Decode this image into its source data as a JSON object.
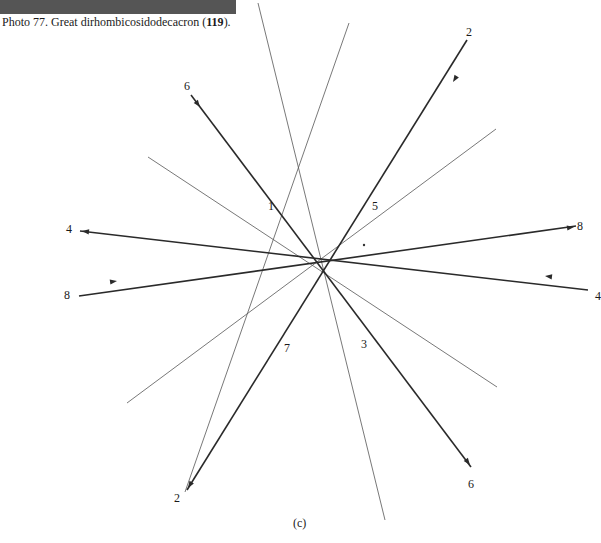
{
  "caption": {
    "prefix": "Photo 77.  Great dirhombicosidodecacron (",
    "number": "119",
    "suffix": ")."
  },
  "figure_label": "(c)",
  "vertex_labels": [
    {
      "id": "v1",
      "text": "1",
      "x": 268,
      "y": 200
    },
    {
      "id": "v5",
      "text": "5",
      "x": 372,
      "y": 200
    },
    {
      "id": "v7",
      "text": "7",
      "x": 284,
      "y": 342
    },
    {
      "id": "v3",
      "text": "3",
      "x": 361,
      "y": 338
    }
  ],
  "end_labels": [
    {
      "id": "e6-top",
      "text": "6",
      "x": 184,
      "y": 80
    },
    {
      "id": "e2-top",
      "text": "2",
      "x": 466,
      "y": 26
    },
    {
      "id": "e4-left",
      "text": "4",
      "x": 66,
      "y": 223
    },
    {
      "id": "e8-right",
      "text": "8",
      "x": 577,
      "y": 220
    },
    {
      "id": "e8-left",
      "text": "8",
      "x": 64,
      "y": 289
    },
    {
      "id": "e4-right",
      "text": "4",
      "x": 595,
      "y": 290
    },
    {
      "id": "e2-bottom",
      "text": "2",
      "x": 174,
      "y": 492
    },
    {
      "id": "e6-bottom",
      "text": "6",
      "x": 468,
      "y": 478
    }
  ],
  "heavy_lines": [
    {
      "id": "line-6",
      "x1": 191,
      "y1": 95,
      "x2": 471,
      "y2": 467,
      "arrows": [
        {
          "x": 200,
          "y": 107,
          "dir": "fwd"
        },
        {
          "x": 470,
          "y": 465,
          "dir": "fwd"
        }
      ]
    },
    {
      "id": "line-2",
      "x1": 467,
      "y1": 40,
      "x2": 187,
      "y2": 490,
      "arrows": [
        {
          "x": 453,
          "y": 82,
          "dir": "fwd"
        },
        {
          "x": 188,
          "y": 488,
          "dir": "fwd"
        }
      ]
    },
    {
      "id": "line-4",
      "x1": 588,
      "y1": 290,
      "x2": 80,
      "y2": 231,
      "arrows": [
        {
          "x": 545,
          "y": 276,
          "dir": "fwd"
        },
        {
          "x": 82,
          "y": 231,
          "dir": "fwd"
        }
      ]
    },
    {
      "id": "line-8",
      "x1": 79,
      "y1": 296,
      "x2": 576,
      "y2": 226,
      "arrows": [
        {
          "x": 117,
          "y": 281,
          "dir": "fwd"
        },
        {
          "x": 574,
          "y": 227,
          "dir": "fwd"
        }
      ]
    }
  ],
  "light_lines": [
    {
      "id": "light-a",
      "x1": 258,
      "y1": 3,
      "x2": 385,
      "y2": 520
    },
    {
      "id": "light-b",
      "x1": 349,
      "y1": 23,
      "x2": 185,
      "y2": 492
    },
    {
      "id": "light-c",
      "x1": 148,
      "y1": 157,
      "x2": 497,
      "y2": 387
    },
    {
      "id": "light-d",
      "x1": 127,
      "y1": 403,
      "x2": 496,
      "y2": 129
    }
  ],
  "colors": {
    "strip": "#555555",
    "heavy": "#2a2a2a",
    "light": "#555555",
    "text": "#1a1a1a"
  }
}
